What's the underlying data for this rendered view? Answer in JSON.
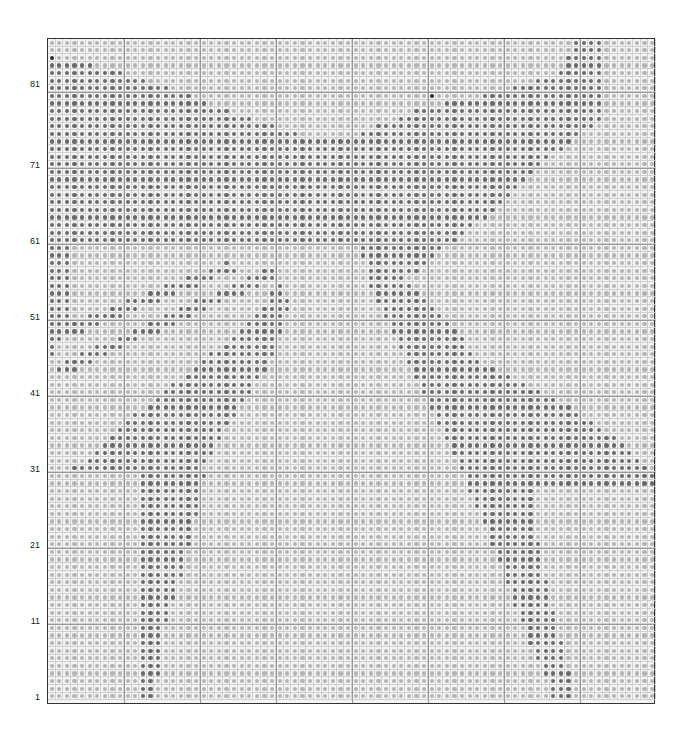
{
  "chart": {
    "grid": {
      "cols": 80,
      "rows": 87,
      "origin_x": 47,
      "origin_y": 38,
      "cell": 7.6,
      "major_every": 10
    },
    "colors": {
      "light_dot": "#b4b4b4",
      "dark_dot": "#6a6a6a",
      "darkest_dot": "#2a2a2a",
      "grid_line": "#cfcfcf",
      "major_line": "#999999",
      "border": "#333333"
    },
    "row_labels": [
      {
        "text": "81",
        "y": 85
      },
      {
        "text": "71",
        "y": 166
      },
      {
        "text": "61",
        "y": 242
      },
      {
        "text": "51",
        "y": 318
      },
      {
        "text": "41",
        "y": 394
      },
      {
        "text": "31",
        "y": 470
      },
      {
        "text": "21",
        "y": 546
      },
      {
        "text": "11",
        "y": 622
      },
      {
        "text": "1",
        "y": 698
      }
    ],
    "dark_regions": [
      {
        "name": "upper-left-wing",
        "points": [
          [
            47,
            55
          ],
          [
            120,
            70
          ],
          [
            230,
            110
          ],
          [
            300,
            135
          ],
          [
            300,
            245
          ],
          [
            47,
            245
          ]
        ]
      },
      {
        "name": "left-wing-lower-strip",
        "points": [
          [
            47,
            245
          ],
          [
            70,
            245
          ],
          [
            70,
            330
          ],
          [
            47,
            360
          ]
        ]
      },
      {
        "name": "center-block",
        "points": [
          [
            300,
            135
          ],
          [
            370,
            135
          ],
          [
            370,
            245
          ],
          [
            300,
            245
          ]
        ]
      },
      {
        "name": "right-wing",
        "points": [
          [
            575,
            40
          ],
          [
            600,
            40
          ],
          [
            600,
            120
          ],
          [
            545,
            160
          ],
          [
            470,
            230
          ],
          [
            440,
            250
          ],
          [
            420,
            270
          ],
          [
            370,
            290
          ],
          [
            360,
            245
          ],
          [
            360,
            130
          ],
          [
            430,
            105
          ],
          [
            500,
            90
          ],
          [
            560,
            70
          ]
        ]
      },
      {
        "name": "left-diag-strip-1",
        "points": [
          [
            47,
            330
          ],
          [
            230,
            260
          ],
          [
            240,
            268
          ],
          [
            47,
            345
          ]
        ]
      },
      {
        "name": "left-diag-strip-2",
        "points": [
          [
            55,
            365
          ],
          [
            270,
            265
          ],
          [
            280,
            275
          ],
          [
            60,
            375
          ]
        ]
      },
      {
        "name": "left-triangle",
        "points": [
          [
            70,
            470
          ],
          [
            150,
            400
          ],
          [
            240,
            330
          ],
          [
            280,
            280
          ],
          [
            290,
            300
          ],
          [
            270,
            360
          ],
          [
            230,
            420
          ],
          [
            200,
            470
          ]
        ]
      },
      {
        "name": "left-leg",
        "points": [
          [
            140,
            470
          ],
          [
            205,
            470
          ],
          [
            185,
            560
          ],
          [
            160,
            640
          ],
          [
            155,
            704
          ],
          [
            140,
            704
          ]
        ]
      },
      {
        "name": "right-band",
        "points": [
          [
            380,
            270
          ],
          [
            420,
            290
          ],
          [
            480,
            360
          ],
          [
            560,
            400
          ],
          [
            620,
            440
          ],
          [
            655,
            475
          ],
          [
            655,
            485
          ],
          [
            470,
            485
          ],
          [
            440,
            430
          ],
          [
            400,
            350
          ],
          [
            375,
            300
          ]
        ]
      },
      {
        "name": "right-leg",
        "points": [
          [
            460,
            480
          ],
          [
            530,
            480
          ],
          [
            540,
            560
          ],
          [
            560,
            640
          ],
          [
            575,
            704
          ],
          [
            555,
            704
          ],
          [
            520,
            620
          ],
          [
            490,
            540
          ]
        ]
      },
      {
        "name": "top-right-column",
        "points": [
          [
            580,
            40
          ],
          [
            600,
            40
          ],
          [
            600,
            95
          ],
          [
            580,
            95
          ]
        ]
      }
    ],
    "darkest_cells": [
      [
        0,
        2
      ],
      [
        50,
        7
      ]
    ]
  }
}
